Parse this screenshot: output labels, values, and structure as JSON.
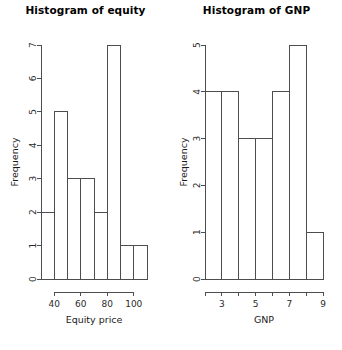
{
  "chart_data": [
    {
      "type": "bar",
      "title": "Histogram of equity",
      "xlabel": "Equity price",
      "ylabel": "Frequency",
      "categories": [
        "30-40",
        "40-50",
        "50-60",
        "60-70",
        "70-80",
        "80-90",
        "90-100",
        "100-110"
      ],
      "bin_edges": [
        30,
        40,
        50,
        60,
        70,
        80,
        90,
        100,
        110
      ],
      "values": [
        2,
        5,
        3,
        3,
        2,
        7,
        1,
        1
      ],
      "xticks": [
        40,
        60,
        80,
        100
      ],
      "xtick_labels": [
        "40",
        "60",
        "80",
        "100"
      ],
      "yticks": [
        0,
        1,
        2,
        3,
        4,
        5,
        6,
        7
      ],
      "ytick_labels": [
        "0",
        "1",
        "2",
        "3",
        "4",
        "5",
        "6",
        "7"
      ],
      "xlim": [
        30,
        110
      ],
      "ylim": [
        0,
        7
      ],
      "grid": false,
      "legend": false
    },
    {
      "type": "bar",
      "title": "Histogram of GNP",
      "xlabel": "GNP",
      "ylabel": "Frequency",
      "categories": [
        "2-3",
        "3-4",
        "4-5",
        "5-6",
        "6-7",
        "7-8",
        "8-9",
        "9-10"
      ],
      "bin_edges": [
        2,
        3,
        4,
        5,
        6,
        7,
        8,
        9,
        10
      ],
      "values": [
        4,
        4,
        3,
        3,
        4,
        5,
        1
      ],
      "xticks": [
        3,
        5,
        7,
        9
      ],
      "xtick_labels": [
        "3",
        "5",
        "7",
        "9"
      ],
      "xtick_all": [
        2,
        3,
        4,
        5,
        6,
        7,
        8,
        9
      ],
      "yticks": [
        0,
        1,
        2,
        3,
        4,
        5
      ],
      "ytick_labels": [
        "0",
        "1",
        "2",
        "3",
        "4",
        "5"
      ],
      "xlim": [
        2,
        9
      ],
      "ylim": [
        0,
        5
      ],
      "grid": false,
      "legend": false
    }
  ],
  "figure": {
    "background_color": "#ffffff",
    "line_color": "#4d4d4d",
    "text_color": "#000000",
    "panels": 2
  }
}
